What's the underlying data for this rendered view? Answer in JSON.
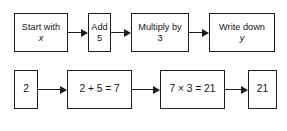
{
  "diagram": {
    "colors": {
      "stroke": "#1d1d1d",
      "text": "#141414",
      "background": "#ffffff"
    },
    "top_row": {
      "label": "function machine steps",
      "boxes": [
        {
          "name": "start-with-x",
          "line1": "Start with",
          "line2": "x",
          "line2_italic": true
        },
        {
          "name": "add-5",
          "line1": "Add",
          "line2": "5",
          "line2_italic": false
        },
        {
          "name": "multiply-by-3",
          "line1": "Multiply by",
          "line2": "3",
          "line2_italic": false
        },
        {
          "name": "write-down-y",
          "line1": "Write down",
          "line2": "y",
          "line2_italic": true
        }
      ]
    },
    "bottom_row": {
      "label": "worked example values",
      "boxes": [
        {
          "name": "input-value",
          "text": "2"
        },
        {
          "name": "addition-step",
          "text": "2 + 5 = 7"
        },
        {
          "name": "multiplication-step",
          "text": "7 × 3 = 21"
        },
        {
          "name": "output-value",
          "text": "21"
        }
      ]
    }
  }
}
